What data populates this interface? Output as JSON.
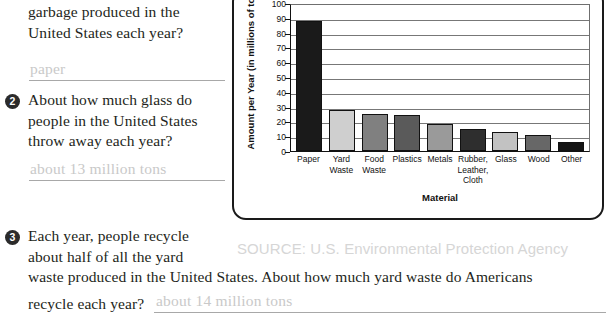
{
  "worksheet": {
    "questions": [
      {
        "number": "",
        "lines": [
          "garbage produced in the",
          "United States each year?"
        ],
        "answer": "paper"
      },
      {
        "number": "2",
        "lines": [
          "About how much glass do",
          "people in the United States",
          "throw away each year?"
        ],
        "answer": "about 13 million tons"
      },
      {
        "number": "3",
        "lines": [
          "Each year, people recycle",
          "about half of all the yard"
        ],
        "continuation": "waste produced in the United States. About how much yard waste do Americans",
        "tail": "recycle each year?",
        "answer": "about 14 million tons"
      }
    ]
  },
  "source_note": "SOURCE: U.S. Environmental Protection Agency",
  "chart_data": {
    "type": "bar",
    "title": "",
    "xlabel": "Material",
    "ylabel": "Amount per Year (in millions of tons)",
    "ylim": [
      0,
      100
    ],
    "ytick_step": 10,
    "ytick_labels": [
      "100",
      "90",
      "80",
      "70",
      "60",
      "50",
      "40",
      "30",
      "20",
      "10",
      "0"
    ],
    "grid": true,
    "legend": "none",
    "categories": [
      "Paper",
      "Yard\nWaste",
      "Food\nWaste",
      "Plastics",
      "Metals",
      "Rubber,\nLeather,\nCloth",
      "Glass",
      "Wood",
      "Other"
    ],
    "values": [
      88,
      28,
      25,
      24,
      18,
      15,
      13,
      11,
      6
    ],
    "bar_colors": [
      "#1a1a1a",
      "#cfcfcf",
      "#808080",
      "#5a5a5a",
      "#9a9a9a",
      "#2e2e2e",
      "#c2c2c2",
      "#676767",
      "#141414"
    ]
  }
}
